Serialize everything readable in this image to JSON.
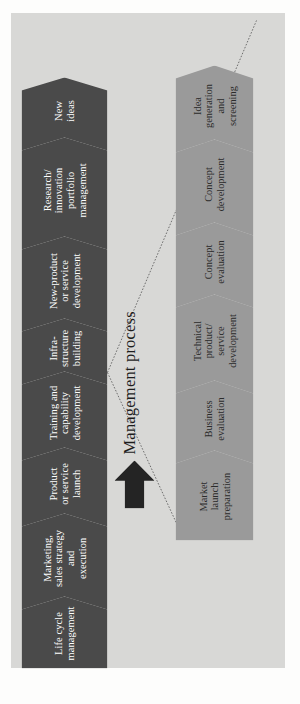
{
  "diagram": {
    "caption": "Management process",
    "colors": {
      "panel_background": "#d8d8d6",
      "dark_chevron": "#4a4a4a",
      "light_chevron": "#9a9a9a",
      "dark_chevron_text": "#ffffff",
      "light_chevron_text": "#2b2b2b",
      "arrow": "#242424",
      "connector_line": "#6e6e6e"
    },
    "top_row": {
      "name": "innovation-process-stages",
      "stages": [
        {
          "id": "new-ideas",
          "label": "New\nideas"
        },
        {
          "id": "research-innovation-portfolio-management",
          "label": "Research/\ninnovation\nportfolio\nmanagement"
        },
        {
          "id": "new-product-or-service-development",
          "label": "New-product\nor service\ndevelopment"
        },
        {
          "id": "infrastructure-building",
          "label": "Infra-\nstructure\nbuilding"
        },
        {
          "id": "training-and-capability-development",
          "label": "Training and\ncapability\ndevelopment"
        },
        {
          "id": "product-or-service-launch",
          "label": "Product\nor service\nlaunch"
        },
        {
          "id": "marketing-sales-strategy-and-execution",
          "label": "Marketing,\nsales strategy\nand\nexecution"
        },
        {
          "id": "life-cycle-management",
          "label": "Life cycle\nmanagement"
        }
      ]
    },
    "bottom_row": {
      "name": "new-product-development-substages",
      "stages": [
        {
          "id": "idea-generation-and-screening",
          "label": "Idea\ngeneration\nand\nscreening"
        },
        {
          "id": "concept-development",
          "label": "Concept\ndevelopment"
        },
        {
          "id": "concept-evaluation",
          "label": "Concept\nevaluation"
        },
        {
          "id": "technical-product-service-development",
          "label": "Technical\nproduct/\nservice\ndevelopment"
        },
        {
          "id": "business-evaluation",
          "label": "Business\nevaluation"
        },
        {
          "id": "market-launch-preparation",
          "label": "Market\nlaunch\npreparation"
        }
      ]
    },
    "arrow": {
      "name": "management-process-arrow",
      "direction": "right"
    },
    "connectors": [
      {
        "name": "expansion-connector-upper",
        "from_stage": "new-product-or-service-development",
        "to_stage": "market-launch-preparation"
      },
      {
        "name": "expansion-connector-lower",
        "from_stage": "new-product-or-service-development",
        "to_stage": "idea-generation-and-screening"
      }
    ]
  }
}
